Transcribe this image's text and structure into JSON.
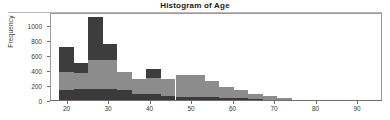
{
  "chart_data": {
    "type": "bar",
    "subtype": "stacked-histogram",
    "title": "Histogram of Age",
    "xlabel": "",
    "ylabel": "Frequency",
    "xlim": [
      16,
      96
    ],
    "ylim": [
      0,
      1180
    ],
    "grid": false,
    "legend": "none",
    "bin_width": 3.5,
    "x_ticks": [
      20,
      30,
      40,
      50,
      60,
      70,
      80,
      90
    ],
    "y_ticks": [
      0,
      200,
      400,
      600,
      800,
      1000
    ],
    "bin_starts": [
      18.0,
      21.5,
      25.0,
      28.5,
      32.0,
      35.5,
      39.0,
      42.5,
      46.0,
      49.5,
      53.0,
      56.5,
      60.0,
      63.5,
      67.0,
      70.5,
      74.0,
      77.5,
      81.0,
      84.5,
      88.0,
      91.5
    ],
    "bin_ends": [
      21.5,
      25.0,
      28.5,
      32.0,
      35.5,
      39.0,
      42.5,
      46.0,
      49.5,
      53.0,
      56.5,
      60.0,
      63.5,
      67.0,
      70.5,
      74.0,
      77.5,
      81.0,
      84.5,
      88.0,
      91.5,
      95.0
    ],
    "series": [
      {
        "name": "bottom-dark",
        "color": "#3a3a3a",
        "values": [
          150,
          160,
          160,
          160,
          150,
          95,
          90,
          70,
          60,
          55,
          50,
          45,
          35,
          25,
          18,
          10,
          6,
          4,
          3,
          2,
          1,
          1
        ]
      },
      {
        "name": "middle-gray",
        "color": "#8c8c8c",
        "values": [
          240,
          215,
          390,
          390,
          235,
          200,
          215,
          230,
          290,
          290,
          215,
          140,
          115,
          75,
          50,
          25,
          14,
          9,
          6,
          4,
          2,
          1
        ]
      },
      {
        "name": "top-dark",
        "color": "#3d3d3d",
        "values": [
          330,
          135,
          580,
          210,
          0,
          0,
          125,
          0,
          0,
          0,
          0,
          0,
          0,
          0,
          0,
          0,
          0,
          0,
          0,
          0,
          0,
          0
        ]
      }
    ],
    "totals": [
      720,
      510,
      1130,
      760,
      385,
      295,
      430,
      300,
      350,
      345,
      265,
      185,
      150,
      100,
      68,
      35,
      20,
      13,
      9,
      6,
      3,
      2
    ]
  },
  "colors": {
    "background": "#ffffff",
    "frame": "#9a9a9a",
    "axis": "#6e6e6e",
    "text": "#3a3a3a",
    "title": "#1a1a1a",
    "bottom_dark": "#3a3a3a",
    "middle_gray": "#8c8c8c",
    "top_dark": "#3d3d3d"
  }
}
